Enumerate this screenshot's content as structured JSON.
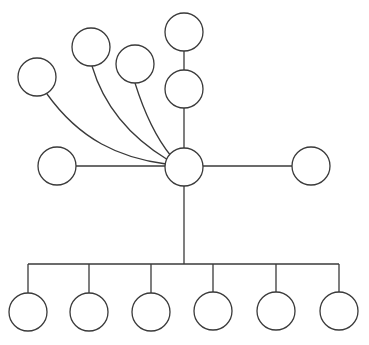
{
  "diagram": {
    "type": "tree-diagram",
    "stroke_color": "#3a3a3a",
    "fill_color": "#ffffff",
    "background": "#ffffff",
    "node_radius": 19,
    "nodes": [
      {
        "id": "hub",
        "cx": 184,
        "cy": 167
      },
      {
        "id": "top-upper",
        "cx": 184,
        "cy": 32
      },
      {
        "id": "top-lower",
        "cx": 184,
        "cy": 89
      },
      {
        "id": "fan-left",
        "cx": 37,
        "cy": 77
      },
      {
        "id": "fan-mid",
        "cx": 91,
        "cy": 47
      },
      {
        "id": "fan-right",
        "cx": 135,
        "cy": 64
      },
      {
        "id": "side-left",
        "cx": 57,
        "cy": 166
      },
      {
        "id": "side-right",
        "cx": 311,
        "cy": 166
      },
      {
        "id": "child-1",
        "cx": 28,
        "cy": 312
      },
      {
        "id": "child-2",
        "cx": 89,
        "cy": 312
      },
      {
        "id": "child-3",
        "cx": 151,
        "cy": 312
      },
      {
        "id": "child-4",
        "cx": 213,
        "cy": 311
      },
      {
        "id": "child-5",
        "cx": 276,
        "cy": 311
      },
      {
        "id": "child-6",
        "cx": 339,
        "cy": 311
      }
    ],
    "edges": [
      {
        "id": "top-upper-to-top-lower",
        "d": "M184 51 L184 70"
      },
      {
        "id": "top-lower-to-hub",
        "d": "M184 108 L184 148"
      },
      {
        "id": "fan-left-to-hub",
        "d": "M47 94 C 80 140, 120 158, 166 164"
      },
      {
        "id": "fan-mid-to-hub",
        "d": "M92 66 C 105 110, 135 140, 168 160"
      },
      {
        "id": "fan-right-to-hub",
        "d": "M135 83 C 145 115, 158 140, 171 156"
      },
      {
        "id": "side-left-to-hub",
        "d": "M76 166 L165 166"
      },
      {
        "id": "hub-to-side-right",
        "d": "M203 166 L292 166"
      },
      {
        "id": "hub-trunk",
        "d": "M184 186 L184 264"
      },
      {
        "id": "bus",
        "d": "M28 264 L339 264"
      },
      {
        "id": "bus-to-child-1",
        "d": "M28 264 L28 293"
      },
      {
        "id": "bus-to-child-2",
        "d": "M89 264 L89 293"
      },
      {
        "id": "bus-to-child-3",
        "d": "M151 264 L151 293"
      },
      {
        "id": "bus-to-child-4",
        "d": "M213 264 L213 292"
      },
      {
        "id": "bus-to-child-5",
        "d": "M276 264 L276 292"
      },
      {
        "id": "bus-to-child-6",
        "d": "M339 264 L339 292"
      }
    ]
  }
}
